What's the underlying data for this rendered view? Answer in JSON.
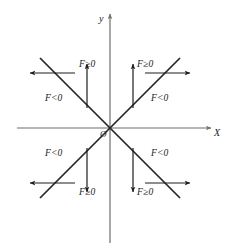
{
  "figure": {
    "type": "math-sign-diagram",
    "background_color": "#ffffff",
    "axis_color": "#6e6e6e",
    "line_color": "#262626",
    "text_color": "#1a1a1a",
    "axes": {
      "x_label": "X",
      "y_label": "y",
      "origin_label": "O"
    },
    "region_labels": [
      {
        "key": "top-upper",
        "text": "F≥0"
      },
      {
        "key": "top-right-upper",
        "text": "F≥0"
      },
      {
        "key": "left-middle",
        "text": "F<0"
      },
      {
        "key": "right-middle",
        "text": "F<0"
      },
      {
        "key": "left-lower",
        "text": "F<0"
      },
      {
        "key": "right-lower",
        "text": "F<0"
      },
      {
        "key": "bottom-left-lower",
        "text": "F≥0"
      },
      {
        "key": "bottom-right-lower",
        "text": "F≥0"
      }
    ],
    "direction_arrows": [
      {
        "key": "upper-left-horizontal",
        "direction": "left"
      },
      {
        "key": "upper-right-horizontal",
        "direction": "right"
      },
      {
        "key": "upper-left-vertical",
        "direction": "up"
      },
      {
        "key": "upper-right-vertical",
        "direction": "up"
      },
      {
        "key": "lower-left-horizontal",
        "direction": "left"
      },
      {
        "key": "lower-right-horizontal",
        "direction": "right"
      },
      {
        "key": "lower-left-vertical",
        "direction": "down"
      },
      {
        "key": "lower-right-vertical",
        "direction": "down"
      }
    ],
    "diagonals": [
      {
        "key": "diagonal-rising",
        "description": "y = x line through origin"
      },
      {
        "key": "diagonal-falling",
        "description": "y = -x line through origin"
      }
    ]
  }
}
